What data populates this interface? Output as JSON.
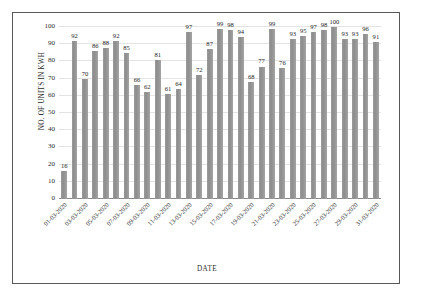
{
  "chart_data": {
    "type": "bar",
    "title": "",
    "xlabel": "DATE",
    "ylabel": "NO. OF UNITS IN KWH",
    "ylim": [
      0,
      100
    ],
    "ytick_values": [
      0,
      10,
      20,
      30,
      40,
      50,
      60,
      70,
      80,
      90,
      100
    ],
    "grid": true,
    "legend": "none",
    "bar_color": "#989898",
    "data_labels": true,
    "categories": [
      "01-03-2020",
      "02-03-2020",
      "03-03-2020",
      "04-03-2020",
      "05-03-2020",
      "06-03-2020",
      "07-03-2020",
      "08-03-2020",
      "09-03-2020",
      "10-03-2020",
      "11-03-2020",
      "12-03-2020",
      "13-03-2020",
      "14-03-2020",
      "15-03-2020",
      "16-03-2020",
      "17-03-2020",
      "18-03-2020",
      "19-03-2020",
      "20-03-2020",
      "21-03-2020",
      "22-03-2020",
      "23-03-2020",
      "24-03-2020",
      "25-03-2020",
      "26-03-2020",
      "27-03-2020",
      "28-03-2020",
      "29-03-2020",
      "30-03-2020",
      "31-03-2020"
    ],
    "values": [
      16,
      92,
      70,
      86,
      88,
      92,
      85,
      66,
      62,
      81,
      61,
      64,
      97,
      72,
      87,
      99,
      98,
      94,
      68,
      77,
      99,
      76,
      93,
      95,
      97,
      98,
      100,
      93,
      93,
      96,
      91
    ],
    "xtick_labels": [
      "01-03-2020",
      "03-03-2020",
      "05-03-2020",
      "07-03-2020",
      "09-03-2020",
      "11-03-2020",
      "13-03-2020",
      "15-03-2020",
      "17-03-2020",
      "19-03-2020",
      "21-03-2020",
      "23-03-2020",
      "25-03-2020",
      "27-03-2020",
      "29-03-2020",
      "31-03-2020"
    ],
    "xtick_indices": [
      0,
      2,
      4,
      6,
      8,
      10,
      12,
      14,
      16,
      18,
      20,
      22,
      24,
      26,
      28,
      30
    ]
  }
}
